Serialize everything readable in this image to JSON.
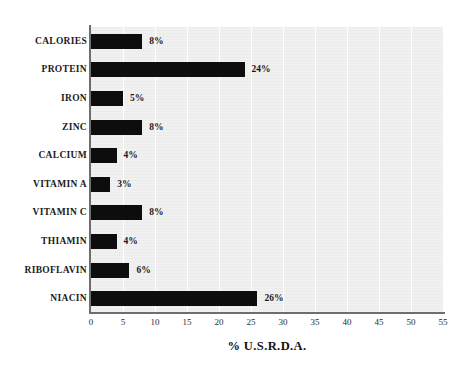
{
  "chart_data": {
    "type": "bar",
    "orientation": "horizontal",
    "title": "",
    "xlabel": "% U.S.R.D.A.",
    "ylabel": "",
    "xlim": [
      0,
      55
    ],
    "xticks": [
      0,
      5,
      10,
      15,
      20,
      25,
      30,
      35,
      40,
      45,
      50,
      55
    ],
    "xtick_labels": [
      "0",
      "5",
      "10",
      "15",
      "20",
      "25",
      "30",
      "35",
      "40",
      "45",
      "50",
      "55"
    ],
    "grid": "vertical-light",
    "legend": "none",
    "bar_color": "#0d0d0d",
    "plot_background": "#f1f1f1",
    "axis_color": "#6e6e6e",
    "categories": [
      "CALORIES",
      "PROTEIN",
      "IRON",
      "ZINC",
      "CALCIUM",
      "VITAMIN A",
      "VITAMIN C",
      "THIAMIN",
      "RIBOFLAVIN",
      "NIACIN"
    ],
    "values": [
      8,
      24,
      5,
      8,
      4,
      3,
      8,
      4,
      6,
      26
    ],
    "data_labels": [
      "8%",
      "24%",
      "5%",
      "8%",
      "4%",
      "3%",
      "8%",
      "4%",
      "6%",
      "26%"
    ]
  }
}
